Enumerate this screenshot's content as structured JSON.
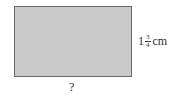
{
  "diagram": {
    "shape": "rectangle",
    "fill_color": "#c9c9c9",
    "border_color": "#6a6a6a",
    "height_label": {
      "whole": "1",
      "numerator": "3",
      "denominator": "4",
      "unit": "cm"
    },
    "width_label": "?"
  }
}
